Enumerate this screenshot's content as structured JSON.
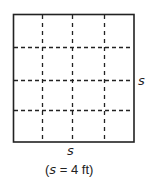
{
  "figure": {
    "type": "square-grid",
    "grid_rows": 4,
    "grid_cols": 4,
    "colors": {
      "outline": "#222222",
      "dashes": "#222222",
      "background": "#ffffff"
    }
  },
  "labels": {
    "right_side": "s",
    "bottom_side": "s",
    "caption_open": "(",
    "caption_var": "s",
    "caption_rest": " = 4 ft)"
  }
}
